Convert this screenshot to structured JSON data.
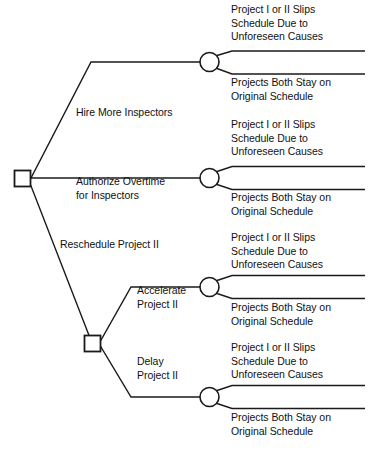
{
  "diagram": {
    "type": "decision-tree",
    "title": "",
    "root": {
      "node_type": "decision-square"
    },
    "branches": [
      {
        "id": "hire-more-inspectors",
        "label": "Hire More Inspectors"
      },
      {
        "id": "authorize-overtime",
        "label": "Authorize Overtime\nfor Inspectors"
      },
      {
        "id": "reschedule-project-ii",
        "label": "Reschedule Project II"
      },
      {
        "id": "accelerate-project-ii",
        "label": "Accelerate\nProject II"
      },
      {
        "id": "delay-project-ii",
        "label": "Delay\nProject II"
      }
    ],
    "chance_nodes": [
      {
        "id": "chance-1",
        "outcomes": [
          {
            "id": "slip-1",
            "label": "Project I or II Slips\nSchedule Due to\nUnforeseen Causes"
          },
          {
            "id": "stay-1",
            "label": "Projects Both Stay on\nOriginal Schedule"
          }
        ]
      },
      {
        "id": "chance-2",
        "outcomes": [
          {
            "id": "slip-2",
            "label": "Project I or II Slips\nSchedule Due to\nUnforeseen Causes"
          },
          {
            "id": "stay-2",
            "label": "Projects Both Stay on\nOriginal Schedule"
          }
        ]
      },
      {
        "id": "chance-3",
        "outcomes": [
          {
            "id": "slip-3",
            "label": "Project I or II Slips\nSchedule Due to\nUnforeseen Causes"
          },
          {
            "id": "stay-3",
            "label": "Projects Both Stay on\nOriginal Schedule"
          }
        ]
      },
      {
        "id": "chance-4",
        "outcomes": [
          {
            "id": "slip-4",
            "label": "Project I or II Slips\nSchedule Due to\nUnforeseen Causes"
          },
          {
            "id": "stay-4",
            "label": "Projects Both Stay on\nOriginal Schedule"
          }
        ]
      }
    ],
    "colors": {
      "line": "#1a1a1a",
      "text": "#111111",
      "background": "#ffffff",
      "node_fill": "#ffffff"
    }
  }
}
